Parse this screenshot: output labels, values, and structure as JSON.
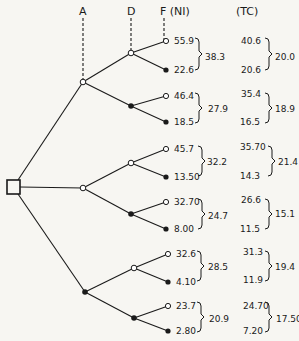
{
  "headers": {
    "A": "A",
    "D": "D",
    "F": "F (NI)",
    "TC": "(TC)"
  },
  "colors": {
    "ink": "#1a1a1a",
    "background": "#f7f6f2"
  },
  "groups": [
    {
      "ni": [
        "55.9",
        "22.6"
      ],
      "ni_avg": "38.3",
      "tc": [
        "40.6",
        "20.6"
      ],
      "tc_avg": "20.0"
    },
    {
      "ni": [
        "46.4",
        "18.5"
      ],
      "ni_avg": "27.9",
      "tc": [
        "35.4",
        "16.5"
      ],
      "tc_avg": "18.9"
    },
    {
      "ni": [
        "45.7",
        "13.50"
      ],
      "ni_avg": "32.2",
      "tc": [
        "35.70",
        "14.3"
      ],
      "tc_avg": "21.4"
    },
    {
      "ni": [
        "32.70",
        "8.00"
      ],
      "ni_avg": "24.7",
      "tc": [
        "26.6",
        "11.5"
      ],
      "tc_avg": "15.1"
    },
    {
      "ni": [
        "32.6",
        "4.10"
      ],
      "ni_avg": "28.5",
      "tc": [
        "31.3",
        "11.9"
      ],
      "tc_avg": "19.4"
    },
    {
      "ni": [
        "23.7",
        "2.80"
      ],
      "ni_avg": "20.9",
      "tc": [
        "24.70",
        "7.20"
      ],
      "tc_avg": "17.50"
    }
  ]
}
